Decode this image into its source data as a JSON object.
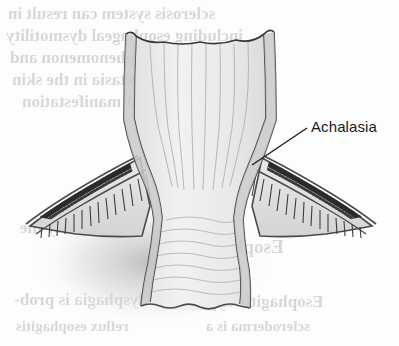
{
  "figure": {
    "title": "Achalasia",
    "background_color": "#fdfdfd",
    "lumen_color": "#ededed",
    "wall_color": "#c9c9c9",
    "wall_outline_color": "#4a4a4a",
    "mucosa_fold_color": "#a9a9a9",
    "label_color": "#1b1b1b",
    "leader_line_color": "#222222",
    "shadow_color": "#c6c6c6"
  },
  "labels": [
    {
      "id": "achalasia",
      "text": "Achalasia",
      "x": 311,
      "y": 118,
      "leader_from_x": 307,
      "leader_from_y": 128,
      "leader_to_x": 252,
      "leader_to_y": 165
    }
  ],
  "bleed_text": {
    "note": "faint mirrored show-through text from the reverse page",
    "lines": [
      {
        "text": "sclerosis system can result in",
        "x": 8,
        "y": 4,
        "size": 17
      },
      {
        "text": "including esophageal dysmotility",
        "x": 6,
        "y": 26,
        "size": 17
      },
      {
        "text": "Raynaud's phenomenon and",
        "x": 10,
        "y": 48,
        "size": 17
      },
      {
        "text": "telangiectasia in the skin",
        "x": 12,
        "y": 70,
        "size": 17
      },
      {
        "text": "the first manifestation",
        "x": 22,
        "y": 92,
        "size": 17
      },
      {
        "text": "is probably the",
        "x": 20,
        "y": 218,
        "size": 17
      },
      {
        "text": "Esophagus",
        "x": 196,
        "y": 236,
        "size": 19
      },
      {
        "text": "dysphagia is prob-",
        "x": 14,
        "y": 290,
        "size": 17
      },
      {
        "text": "Esophagitis Type",
        "x": 200,
        "y": 292,
        "size": 17
      },
      {
        "text": "reflux esophagitis",
        "x": 16,
        "y": 318,
        "size": 15
      },
      {
        "text": "scleroderma is a",
        "x": 206,
        "y": 318,
        "size": 15
      }
    ]
  }
}
